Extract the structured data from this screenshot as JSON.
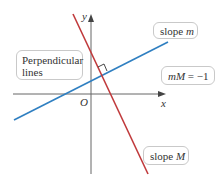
{
  "diagram": {
    "axes": {
      "x_label": "x",
      "y_label": "y",
      "origin_label": "O"
    },
    "labels": {
      "perpendicular": [
        "Perpendicular",
        "lines"
      ],
      "slope_m": {
        "text": "slope ",
        "var": "m"
      },
      "slope_M": {
        "text": "slope ",
        "var": "M"
      },
      "product": {
        "lhs": "mM",
        "rhs": " = −1"
      }
    },
    "colors": {
      "line_m": "#2f7fc1",
      "line_M": "#c0393b",
      "axis": "#666666"
    }
  }
}
